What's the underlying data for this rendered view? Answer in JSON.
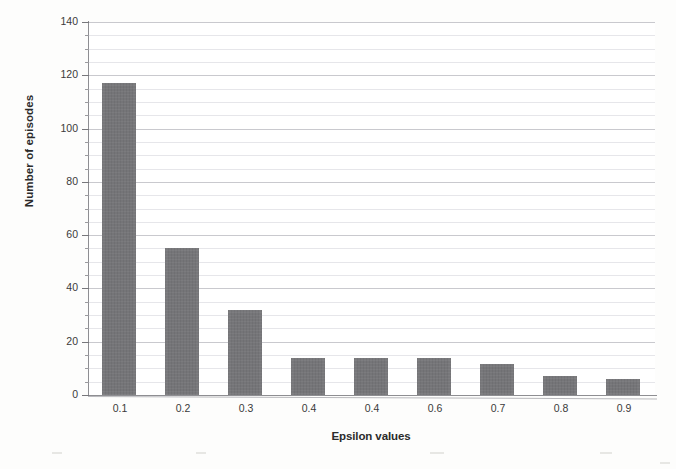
{
  "chart_data": {
    "type": "bar",
    "title": "",
    "subtitle": "",
    "xlabel": "Epsilon values",
    "ylabel": "Number of episodes",
    "categories": [
      "0.1",
      "0.2",
      "0.3",
      "0.4",
      "0.4",
      "0.6",
      "0.7",
      "0.8",
      "0.9"
    ],
    "values": [
      117,
      55,
      32,
      14,
      14,
      14,
      11.5,
      7,
      6
    ],
    "ylim": [
      0,
      140
    ],
    "ytick_labels": [
      "0",
      "20",
      "40",
      "60",
      "80",
      "100",
      "120",
      "140"
    ],
    "ytick_values": [
      0,
      20,
      40,
      60,
      80,
      100,
      120,
      140
    ],
    "ytick_minor_step": 5,
    "grid": "horizontal-major-and-minor",
    "legend": "none",
    "legend_position": "none",
    "series": [
      {
        "name": "Number of episodes",
        "values": [
          117,
          55,
          32,
          14,
          14,
          14,
          11.5,
          7,
          6
        ]
      }
    ],
    "colors": {
      "bar_fill": "#757578",
      "gridline_major": "#c9c9ce",
      "gridline_minor": "#e2e2e6",
      "axis": "#8e8e92",
      "text": "#3a3a3a",
      "title_text": "#2b2b2b",
      "plot_background": "#ffffff",
      "page_background": "#fdfdfc"
    },
    "annotations": []
  }
}
